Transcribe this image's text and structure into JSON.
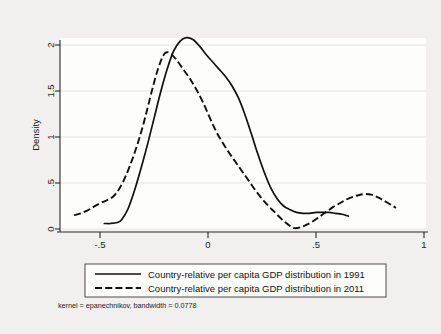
{
  "chart_data": {
    "type": "line",
    "title": "",
    "subtitle": "",
    "xlabel": "",
    "ylabel": "Density",
    "xlim": [
      -0.65,
      1.0
    ],
    "ylim": [
      0,
      2.2
    ],
    "xticks": [
      "-.5",
      "0",
      ".5",
      "1"
    ],
    "xtick_values": [
      -0.5,
      0,
      0.5,
      1
    ],
    "yticks": [
      "0",
      ".5",
      "1",
      "1.5",
      "2"
    ],
    "ytick_values": [
      0,
      0.5,
      1,
      1.5,
      2
    ],
    "grid": true,
    "grid_axis": "y",
    "legend_position": "below-plot",
    "annotation": "kernel = epanechnikov, bandwidth = 0.0778",
    "kernel": "epanechnikov",
    "bandwidth": "0.0778",
    "series": [
      {
        "name": "Country-relative per capita GDP distribution in 1991",
        "style": "solid",
        "x": [
          -0.48,
          -0.45,
          -0.42,
          -0.4,
          -0.37,
          -0.34,
          -0.31,
          -0.28,
          -0.25,
          -0.22,
          -0.19,
          -0.16,
          -0.13,
          -0.1,
          -0.07,
          -0.04,
          -0.01,
          0.02,
          0.05,
          0.08,
          0.11,
          0.14,
          0.17,
          0.2,
          0.23,
          0.26,
          0.29,
          0.32,
          0.35,
          0.38,
          0.41,
          0.44,
          0.47,
          0.5,
          0.53,
          0.56,
          0.59,
          0.62,
          0.65
        ],
        "y": [
          0.06,
          0.06,
          0.07,
          0.1,
          0.22,
          0.42,
          0.66,
          0.92,
          1.2,
          1.48,
          1.73,
          1.93,
          2.04,
          2.08,
          2.06,
          1.99,
          1.9,
          1.82,
          1.74,
          1.66,
          1.56,
          1.43,
          1.25,
          1.04,
          0.82,
          0.62,
          0.45,
          0.33,
          0.25,
          0.21,
          0.18,
          0.17,
          0.17,
          0.18,
          0.18,
          0.18,
          0.17,
          0.16,
          0.14
        ]
      },
      {
        "name": "Country-relative per capita GDP distribution in 2011",
        "style": "dashed",
        "x": [
          -0.62,
          -0.59,
          -0.56,
          -0.53,
          -0.5,
          -0.47,
          -0.44,
          -0.41,
          -0.38,
          -0.35,
          -0.32,
          -0.29,
          -0.26,
          -0.23,
          -0.2,
          -0.17,
          -0.14,
          -0.11,
          -0.08,
          -0.05,
          -0.02,
          0.01,
          0.04,
          0.07,
          0.1,
          0.13,
          0.16,
          0.19,
          0.22,
          0.25,
          0.28,
          0.31,
          0.34,
          0.37,
          0.4,
          0.43,
          0.46,
          0.49,
          0.52,
          0.55,
          0.58,
          0.61,
          0.64,
          0.67,
          0.7,
          0.73,
          0.76,
          0.79,
          0.82,
          0.85,
          0.87
        ],
        "y": [
          0.15,
          0.17,
          0.2,
          0.24,
          0.28,
          0.31,
          0.35,
          0.44,
          0.58,
          0.76,
          0.97,
          1.22,
          1.5,
          1.75,
          1.91,
          1.9,
          1.82,
          1.72,
          1.62,
          1.5,
          1.36,
          1.2,
          1.05,
          0.93,
          0.82,
          0.72,
          0.62,
          0.52,
          0.42,
          0.33,
          0.25,
          0.18,
          0.11,
          0.05,
          0.01,
          0.02,
          0.05,
          0.09,
          0.14,
          0.19,
          0.24,
          0.28,
          0.32,
          0.35,
          0.37,
          0.38,
          0.37,
          0.34,
          0.3,
          0.26,
          0.23
        ]
      }
    ]
  },
  "legend": {
    "items": [
      {
        "label": "Country-relative per capita GDP distribution in 1991",
        "style": "solid"
      },
      {
        "label": "Country-relative per capita GDP distribution in 2011",
        "style": "dashed"
      }
    ]
  },
  "axes": {
    "y_title": "Density"
  },
  "note": "kernel = epanechnikov, bandwidth = 0.0778"
}
